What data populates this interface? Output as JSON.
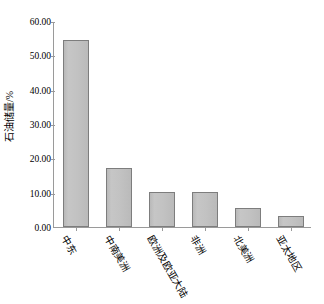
{
  "chart_data": {
    "type": "bar",
    "title": "",
    "subtitle": "",
    "xlabel": "",
    "ylabel": "石油储量/%",
    "categories": [
      "中东",
      "中南美洲",
      "欧洲及欧亚大陆",
      "非洲",
      "北美洲",
      "亚太地区"
    ],
    "values": [
      54.4,
      17.2,
      10.2,
      10.2,
      5.5,
      3.2
    ],
    "ylim": [
      0,
      60
    ],
    "ytick_labels": [
      "60.00",
      "50.00",
      "40.00",
      "30.00",
      "20.00",
      "10.00",
      "0.00"
    ],
    "ytick_values": [
      60,
      50,
      40,
      30,
      20,
      10,
      0
    ],
    "grid": false,
    "legend": null,
    "legend_position": "none",
    "series": [
      {
        "name": "石油储量",
        "values": [
          54.4,
          17.2,
          10.2,
          10.2,
          5.5,
          3.2
        ]
      }
    ],
    "colors": {
      "bar_fill": "#bfbfbf",
      "bar_border": "#7d7d7d",
      "axis": "#9a9a9a",
      "text": "#000000",
      "background": "#ffffff"
    }
  }
}
